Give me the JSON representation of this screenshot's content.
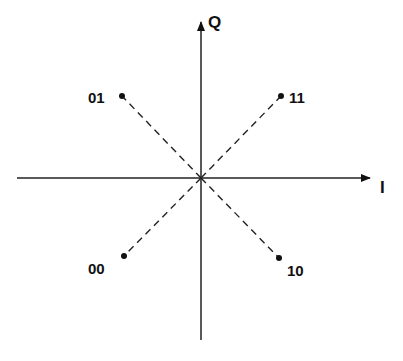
{
  "diagram": {
    "type": "QPSK constellation diagram",
    "axes": {
      "horizontal": {
        "label": "I"
      },
      "vertical": {
        "label": "Q"
      }
    },
    "points": [
      {
        "label": "01",
        "quadrant": "upper-left"
      },
      {
        "label": "11",
        "quadrant": "upper-right"
      },
      {
        "label": "00",
        "quadrant": "lower-left"
      },
      {
        "label": "10",
        "quadrant": "lower-right"
      }
    ],
    "colors": {
      "line": "#111111",
      "background": "#ffffff"
    }
  }
}
